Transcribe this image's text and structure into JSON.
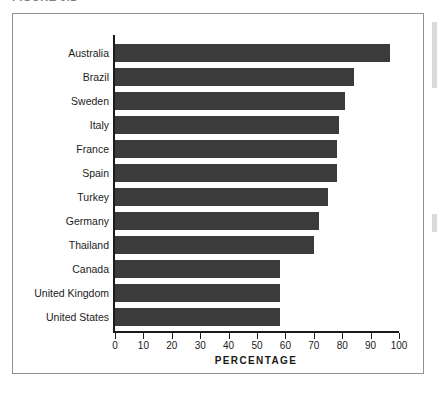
{
  "figure": {
    "caption_fragment": "FIGURE 9.1",
    "frame_color": "#8e9196",
    "background": "#ffffff"
  },
  "chart_data": {
    "type": "bar",
    "orientation": "horizontal",
    "title": "",
    "subtitle": "",
    "xlabel": "PERCENTAGE",
    "ylabel": "",
    "categories": [
      "Australia",
      "Brazil",
      "Sweden",
      "Italy",
      "France",
      "Spain",
      "Turkey",
      "Germany",
      "Thailand",
      "Canada",
      "United Kingdom",
      "United States"
    ],
    "values": [
      97,
      84,
      81,
      79,
      78,
      78,
      75,
      72,
      70,
      58,
      58,
      58
    ],
    "xlim": [
      0,
      100
    ],
    "xticks": [
      0,
      10,
      20,
      30,
      40,
      50,
      60,
      70,
      80,
      90,
      100
    ],
    "xtick_labels": [
      "0",
      "10",
      "20",
      "30",
      "40",
      "50",
      "60",
      "70",
      "80",
      "90",
      "100"
    ],
    "grid": false,
    "legend": null,
    "bar_color": "#3b3b3b",
    "axis_color": "#1b1b1b"
  }
}
